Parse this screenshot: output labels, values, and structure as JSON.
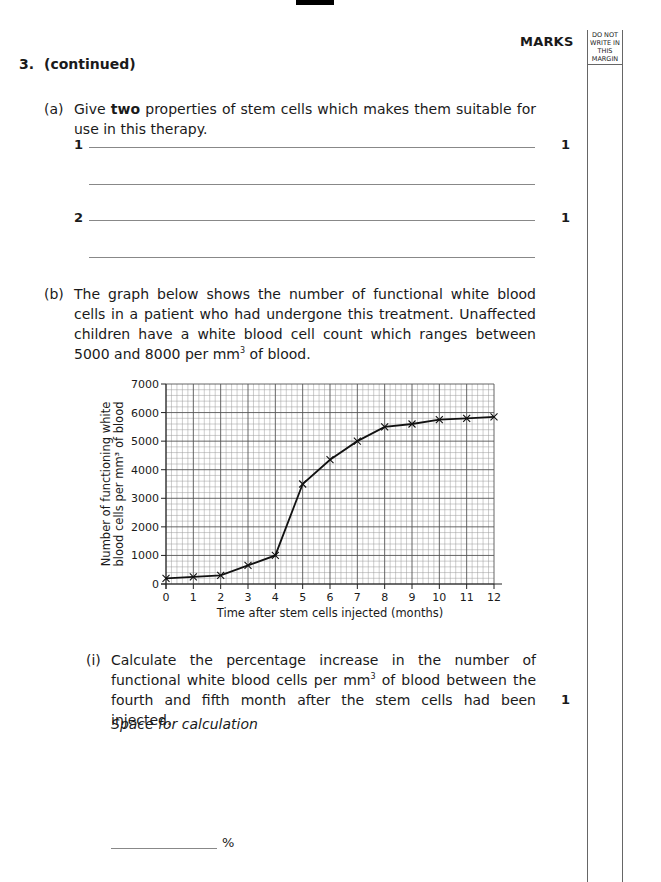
{
  "page": {
    "marks_header": "MARKS",
    "margin_header": [
      "DO NOT",
      "WRITE IN",
      "THIS",
      "MARGIN"
    ]
  },
  "question": {
    "number": "3.",
    "title": "(continued)"
  },
  "part_a": {
    "label": "(a)",
    "text_before": "Give ",
    "text_bold": "two",
    "text_after": " properties of stem cells which makes them suitable for use in this therapy.",
    "answers": [
      {
        "number": "1",
        "marks": "1"
      },
      {
        "number": "2",
        "marks": "1"
      }
    ]
  },
  "part_b": {
    "label": "(b)",
    "text": "The graph below shows the number of functional white blood cells in a patient who had undergone this treatment. Unaffected children have a white blood cell count which ranges between 5000 and 8000 per mm",
    "text_sup": "3",
    "text_end": " of blood."
  },
  "part_b_i": {
    "label": "(i)",
    "text": "Calculate the percentage increase in the number of functional white blood cells per mm",
    "text_sup": "3",
    "text_end": " of blood between the fourth and fifth month after the stem cells had been injected.",
    "marks": "1",
    "calc_label": "Space for calculation",
    "unit": "%"
  },
  "chart_data": {
    "type": "line",
    "title": "",
    "xlabel": "Time after stem cells injected (months)",
    "ylabel_lines": [
      "Number of functioning white",
      "blood cells per mm³ of blood"
    ],
    "x": [
      0,
      1,
      2,
      3,
      4,
      5,
      6,
      7,
      8,
      9,
      10,
      11,
      12
    ],
    "values": [
      200,
      250,
      300,
      650,
      1000,
      3500,
      4350,
      5000,
      5500,
      5600,
      5750,
      5800,
      5850
    ],
    "xlim": [
      0,
      12
    ],
    "ylim": [
      0,
      7000
    ],
    "xticks": [
      "0",
      "1",
      "2",
      "3",
      "4",
      "5",
      "6",
      "7",
      "8",
      "9",
      "10",
      "11",
      "12"
    ],
    "yticks": [
      "0",
      "1000",
      "2000",
      "3000",
      "4000",
      "5000",
      "6000",
      "7000"
    ],
    "ytick_values": [
      0,
      1000,
      2000,
      3000,
      4000,
      5000,
      6000,
      7000
    ],
    "minor_divisions_x": 5,
    "minor_divisions_y": 5,
    "grid": true,
    "marker": "x",
    "legend": "none"
  }
}
